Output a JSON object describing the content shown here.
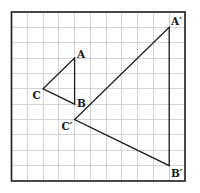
{
  "diagram": {
    "grid": {
      "columns": 11,
      "rows": 11,
      "origin_px": [
        11.5,
        12
      ],
      "cell_width_px": 15.77,
      "cell_height_px": 15.36,
      "line_color": "#c9c9c9",
      "frame_color": "#1a1a1a"
    },
    "triangles": [
      {
        "name": "ABC",
        "vertices": [
          {
            "label": "A",
            "grid": [
              4,
              3
            ]
          },
          {
            "label": "B",
            "grid": [
              4,
              6
            ]
          },
          {
            "label": "C",
            "grid": [
              2,
              5
            ]
          }
        ]
      },
      {
        "name": "A'B'C'",
        "vertices": [
          {
            "label": "A′",
            "grid": [
              10,
              1
            ]
          },
          {
            "label": "B′",
            "grid": [
              10,
              10
            ]
          },
          {
            "label": "C′",
            "grid": [
              4,
              7
            ]
          }
        ]
      }
    ],
    "labels": {
      "A": "A",
      "B": "B",
      "C": "C",
      "A_prime": "A′",
      "B_prime": "B′",
      "C_prime": "C′"
    },
    "line_color": "#1a1a1a",
    "background": "#ffffff"
  }
}
